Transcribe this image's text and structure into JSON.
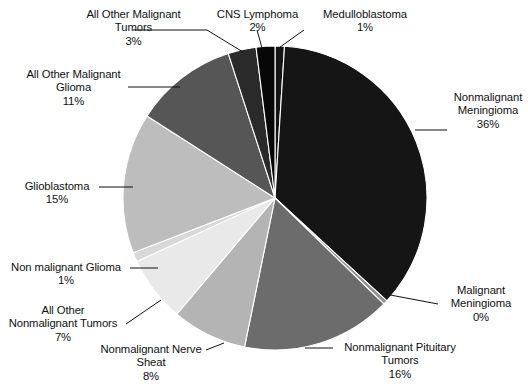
{
  "chart_data": {
    "type": "pie",
    "title": "",
    "subtitle": "",
    "xlabel": "",
    "ylabel": "",
    "legend_position": "none",
    "grid": false,
    "units": "percent",
    "label_format": "name + percent",
    "start_angle_deg": 0,
    "direction": "clockwise",
    "categories": [
      "Medulloblastoma",
      "Nonmalignant Meningioma",
      "Malignant Meningioma",
      "Nonmalignant Pituitary Tumors",
      "Nonmalignant Nerve Sheath",
      "All Other Nonmalignant Tumors",
      "Non malignant Glioma",
      "Glioblastoma",
      "All Other Malignant Glioma",
      "All Other Malignant Tumors",
      "CNS Lymphoma"
    ],
    "values": [
      1,
      36,
      0,
      16,
      8,
      7,
      1,
      15,
      11,
      3,
      2
    ],
    "colors": [
      "#141414",
      "#151515",
      "#8e8e8e",
      "#6c6c6c",
      "#b4b4b4",
      "#e9e9e9",
      "#d8d8d8",
      "#bdbdbd",
      "#565656",
      "#2a2a2a",
      "#070707"
    ],
    "slices": [
      {
        "name": "Medulloblastoma",
        "value": 1,
        "label": "Medulloblastoma",
        "percent": "1%",
        "color": "#141414"
      },
      {
        "name": "Nonmalignant Meningioma",
        "value": 36,
        "label": "Nonmalignant Meningioma",
        "percent": "36%",
        "color": "#151515"
      },
      {
        "name": "Malignant Meningioma",
        "value": 0,
        "label": "Malignant Meningioma",
        "percent": "0%",
        "color": "#8e8e8e"
      },
      {
        "name": "Nonmalignant Pituitary Tumors",
        "value": 16,
        "label": "Nonmalignant Pituitary Tumors",
        "percent": "16%",
        "color": "#6c6c6c"
      },
      {
        "name": "Nonmalignant Nerve Sheath",
        "value": 8,
        "label": "Nonmalignant Nerve Sheat",
        "percent": "8%",
        "color": "#b4b4b4"
      },
      {
        "name": "All Other Nonmalignant Tumors",
        "value": 7,
        "label": "All Other Nonmalignant Tumors",
        "percent": "7%",
        "color": "#e9e9e9"
      },
      {
        "name": "Non malignant Glioma",
        "value": 1,
        "label": "Non malignant Glioma",
        "percent": "1%",
        "color": "#d8d8d8"
      },
      {
        "name": "Glioblastoma",
        "value": 15,
        "label": "Glioblastoma",
        "percent": "15%",
        "color": "#bdbdbd"
      },
      {
        "name": "All Other Malignant Glioma",
        "value": 11,
        "label": "All Other Malignant Glioma",
        "percent": "11%",
        "color": "#565656"
      },
      {
        "name": "All Other Malignant Tumors",
        "value": 3,
        "label": "All Other Malignant Tumors",
        "percent": "3%",
        "color": "#2a2a2a"
      },
      {
        "name": "CNS Lymphoma",
        "value": 2,
        "label": "CNS Lymphoma",
        "percent": "2%",
        "color": "#070707"
      }
    ]
  },
  "labels": {
    "all_other_malignant_tumors": {
      "line1": "All Other Malignant",
      "line2": "Tumors",
      "line3": "3%"
    },
    "cns_lymphoma": {
      "line1": "CNS Lymphoma",
      "line2": "2%"
    },
    "medulloblastoma": {
      "line1": "Medulloblastoma",
      "line2": "1%"
    },
    "all_other_malignant_glioma": {
      "line1": "All Other Malignant",
      "line2": "Glioma",
      "line3": "11%"
    },
    "nonmalignant_meningioma": {
      "line1": "Nonmalignant",
      "line2": "Meningioma",
      "line3": "36%"
    },
    "glioblastoma": {
      "line1": "Glioblastoma",
      "line2": "15%"
    },
    "non_malignant_glioma": {
      "line1": "Non malignant Glioma",
      "line2": "1%"
    },
    "all_other_nonmalignant_tumors": {
      "line1": "All Other",
      "line2": "Nonmalignant Tumors",
      "line3": "7%"
    },
    "nonmalignant_nerve_sheath": {
      "line1": "Nonmalignant Nerve",
      "line2": "Sheat",
      "line3": "8%"
    },
    "nonmalignant_pituitary_tumors": {
      "line1": "Nonmalignant Pituitary",
      "line2": "Tumors",
      "line3": "16%"
    },
    "malignant_meningioma": {
      "line1": "Malignant",
      "line2": "Meningioma",
      "line3": "0%"
    }
  },
  "geometry": {
    "center_x": 275,
    "center_y": 198,
    "radius": 152
  },
  "style": {
    "background": "#ffffff",
    "leader_line_color": "#111111",
    "text_color": "#111111"
  }
}
